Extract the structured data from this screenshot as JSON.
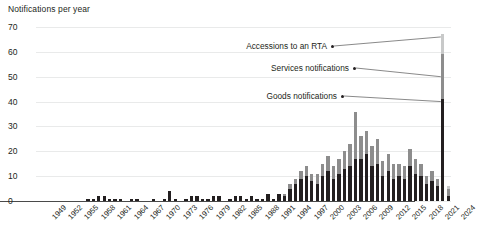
{
  "chart_data": {
    "type": "bar",
    "title": "",
    "subtitle": "",
    "ylabel": "Notifications per year",
    "xlabel": "",
    "ylim": [
      0,
      70
    ],
    "yticks": [
      0,
      10,
      20,
      30,
      40,
      50,
      60,
      70
    ],
    "grid": true,
    "stacked": true,
    "legend_position": "annotations",
    "colors": {
      "goods": "#231f20",
      "services": "#8d8d8d",
      "accessions": "#c8c9c9",
      "gridline": "#e9eaea",
      "axis": "#4a4a4a"
    },
    "categories": [
      1949,
      1950,
      1951,
      1952,
      1953,
      1954,
      1955,
      1956,
      1957,
      1958,
      1959,
      1960,
      1961,
      1962,
      1963,
      1964,
      1965,
      1966,
      1967,
      1968,
      1969,
      1970,
      1971,
      1972,
      1973,
      1974,
      1975,
      1976,
      1977,
      1978,
      1979,
      1980,
      1981,
      1982,
      1983,
      1984,
      1985,
      1986,
      1987,
      1988,
      1989,
      1990,
      1991,
      1992,
      1993,
      1994,
      1995,
      1996,
      1997,
      1998,
      1999,
      2000,
      2001,
      2002,
      2003,
      2004,
      2005,
      2006,
      2007,
      2008,
      2009,
      2010,
      2011,
      2012,
      2013,
      2014,
      2015,
      2016,
      2017,
      2018,
      2019,
      2020,
      2021,
      2022,
      2023,
      2024
    ],
    "tick_labels": [
      "1949",
      "1952",
      "1955",
      "1958",
      "1961",
      "1964",
      "1967",
      "1970",
      "1973",
      "1976",
      "1979",
      "1982",
      "1985",
      "1988",
      "1991",
      "1994",
      "1997",
      "2000",
      "2003",
      "2006",
      "2009",
      "2012",
      "2015",
      "2018",
      "2021",
      "2024"
    ],
    "tick_step": 3,
    "series": [
      {
        "name": "Goods notifications",
        "color": "#231f20",
        "values": [
          0,
          0,
          0,
          0,
          0,
          0,
          0,
          0,
          0,
          1,
          1,
          2,
          2,
          1,
          1,
          1,
          0,
          1,
          1,
          0,
          0,
          1,
          0,
          1,
          4,
          1,
          0,
          1,
          2,
          2,
          1,
          1,
          2,
          2,
          0,
          1,
          2,
          2,
          1,
          2,
          1,
          1,
          3,
          1,
          3,
          2,
          5,
          7,
          9,
          10,
          8,
          7,
          10,
          12,
          9,
          11,
          13,
          14,
          17,
          17,
          19,
          14,
          15,
          10,
          12,
          9,
          10,
          9,
          14,
          11,
          10,
          7,
          8,
          6,
          41,
          2
        ]
      },
      {
        "name": "Services notifications",
        "color": "#8d8d8d",
        "values": [
          0,
          0,
          0,
          0,
          0,
          0,
          0,
          0,
          0,
          0,
          0,
          0,
          0,
          0,
          0,
          0,
          0,
          0,
          0,
          0,
          0,
          0,
          0,
          0,
          0,
          0,
          0,
          0,
          0,
          0,
          0,
          0,
          0,
          0,
          0,
          0,
          0,
          0,
          0,
          0,
          0,
          0,
          0,
          0,
          0,
          1,
          2,
          2,
          3,
          4,
          3,
          4,
          5,
          6,
          5,
          6,
          7,
          9,
          19,
          9,
          9,
          8,
          10,
          6,
          7,
          6,
          5,
          5,
          7,
          6,
          5,
          3,
          4,
          3,
          18,
          3
        ]
      },
      {
        "name": "Accessions to an RTA",
        "color": "#c8c9c9",
        "values": [
          0,
          0,
          0,
          0,
          0,
          0,
          0,
          0,
          0,
          0,
          0,
          0,
          0,
          0,
          0,
          0,
          0,
          0,
          0,
          0,
          0,
          0,
          0,
          0,
          0,
          0,
          0,
          0,
          0,
          0,
          0,
          0,
          0,
          0,
          0,
          0,
          0,
          0,
          0,
          0,
          0,
          0,
          0,
          0,
          0,
          0,
          0,
          0,
          0,
          0,
          0,
          0,
          0,
          0,
          0,
          0,
          0,
          0,
          0,
          0,
          0,
          0,
          0,
          0,
          0,
          0,
          0,
          0,
          0,
          0,
          0,
          0,
          0,
          0,
          8,
          1
        ]
      }
    ],
    "annotations": [
      {
        "label": "Accessions to an RTA",
        "target_year": 2023,
        "target_value": 66
      },
      {
        "label": "Services notifications",
        "target_year": 2023,
        "target_value": 50
      },
      {
        "label": "Goods notifications",
        "target_year": 2023,
        "target_value": 40
      }
    ]
  }
}
